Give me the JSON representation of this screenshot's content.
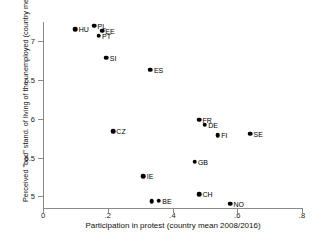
{
  "chart_data": {
    "type": "scatter",
    "title": "",
    "xlabel": "Participation in protest (country mean 2008/2016)",
    "ylabel": "Perceived \"bad\" stand. of living of the unemployed (country  mean 2008/2016)",
    "xlim": [
      0,
      0.8
    ],
    "ylim": [
      4.85,
      7.25
    ],
    "xticks": [
      "0",
      ".2",
      ".4",
      ".6",
      ".8"
    ],
    "xtick_values": [
      0,
      0.2,
      0.4,
      0.6,
      0.8
    ],
    "yticks": [
      "5",
      "5.5",
      "6",
      "6.5",
      "7"
    ],
    "ytick_values": [
      5,
      5.5,
      6,
      6.5,
      7
    ],
    "grid": false,
    "legend": null,
    "points": [
      {
        "label": "HU",
        "x": 0.1,
        "y": 7.155,
        "label_pos": "right"
      },
      {
        "label": "PL",
        "x": 0.158,
        "y": 7.2,
        "label_pos": "right"
      },
      {
        "label": "EE",
        "x": 0.182,
        "y": 7.14,
        "label_pos": "right"
      },
      {
        "label": "PT",
        "x": 0.172,
        "y": 7.075,
        "label_pos": "right"
      },
      {
        "label": "SI",
        "x": 0.196,
        "y": 6.79,
        "label_pos": "right"
      },
      {
        "label": "ES",
        "x": 0.332,
        "y": 6.635,
        "label_pos": "right"
      },
      {
        "label": "FR",
        "x": 0.482,
        "y": 5.99,
        "label_pos": "right"
      },
      {
        "label": "DE",
        "x": 0.5,
        "y": 5.925,
        "label_pos": "right"
      },
      {
        "label": "CZ",
        "x": 0.216,
        "y": 5.84,
        "label_pos": "right"
      },
      {
        "label": "FI",
        "x": 0.54,
        "y": 5.79,
        "label_pos": "right"
      },
      {
        "label": "SE",
        "x": 0.64,
        "y": 5.81,
        "label_pos": "right"
      },
      {
        "label": "GB",
        "x": 0.468,
        "y": 5.445,
        "label_pos": "right"
      },
      {
        "label": "IE",
        "x": 0.31,
        "y": 5.26,
        "label_pos": "right"
      },
      {
        "label": "CH",
        "x": 0.482,
        "y": 5.03,
        "label_pos": "right"
      },
      {
        "label": "",
        "x": 0.336,
        "y": 4.94,
        "label_pos": "right"
      },
      {
        "label": "BE",
        "x": 0.358,
        "y": 4.945,
        "label_pos": "right"
      },
      {
        "label": "NO",
        "x": 0.578,
        "y": 4.905,
        "label_pos": "right"
      }
    ]
  }
}
